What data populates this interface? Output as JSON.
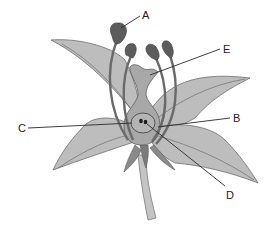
{
  "diagram": {
    "labels": [
      {
        "id": "A",
        "text": "A",
        "x": 142,
        "y": 10
      },
      {
        "id": "B",
        "text": "B",
        "x": 233,
        "y": 113
      },
      {
        "id": "C",
        "text": "C",
        "x": 18,
        "y": 123
      },
      {
        "id": "D",
        "text": "D",
        "x": 226,
        "y": 190
      },
      {
        "id": "E",
        "text": "E",
        "x": 223,
        "y": 44
      }
    ],
    "colors": {
      "petal": "#bdbdbd",
      "petal_outline": "#6e6e6e",
      "pistil": "#a8a8a8",
      "stamen": "#6a6a6a",
      "anther": "#5c5c5c",
      "stem": "#c4c4c4",
      "sepal": "#8a8a8a",
      "leader_line": "#2a2a2a"
    }
  }
}
